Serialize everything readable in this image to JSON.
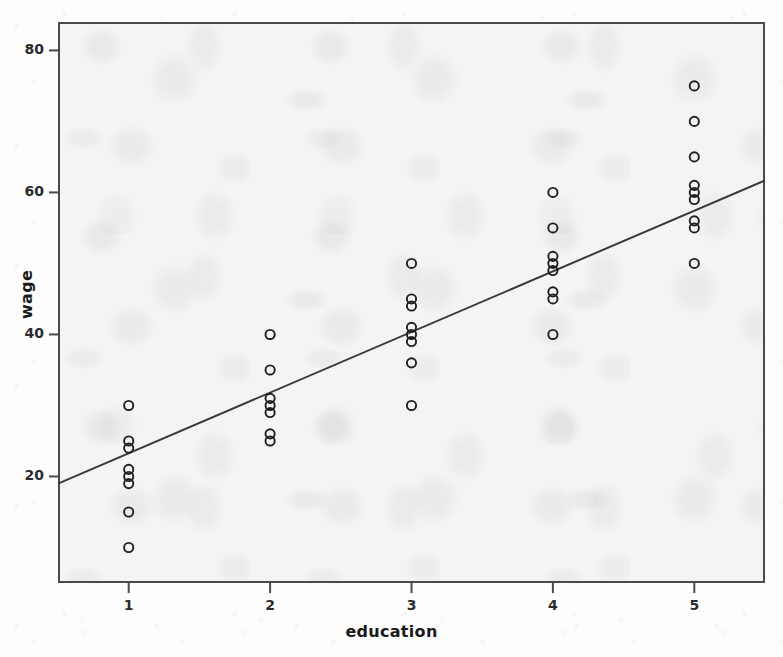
{
  "chart_data": {
    "type": "scatter",
    "title": "",
    "xlabel": "education",
    "ylabel": "wage",
    "xlim": [
      0.5,
      5.5
    ],
    "ylim": [
      5,
      84
    ],
    "grid": false,
    "legend": "none",
    "marker": "open-circle",
    "xticks": [
      "1",
      "2",
      "3",
      "4",
      "5"
    ],
    "xtick_values": [
      1,
      2,
      3,
      4,
      5
    ],
    "yticks": [
      "20",
      "40",
      "60",
      "80"
    ],
    "ytick_values": [
      20,
      40,
      60,
      80
    ],
    "points": [
      {
        "x": 1,
        "y": 30
      },
      {
        "x": 1,
        "y": 25
      },
      {
        "x": 1,
        "y": 24
      },
      {
        "x": 1,
        "y": 21
      },
      {
        "x": 1,
        "y": 20
      },
      {
        "x": 1,
        "y": 19
      },
      {
        "x": 1,
        "y": 15
      },
      {
        "x": 1,
        "y": 10
      },
      {
        "x": 2,
        "y": 40
      },
      {
        "x": 2,
        "y": 35
      },
      {
        "x": 2,
        "y": 31
      },
      {
        "x": 2,
        "y": 30
      },
      {
        "x": 2,
        "y": 29
      },
      {
        "x": 2,
        "y": 26
      },
      {
        "x": 2,
        "y": 25
      },
      {
        "x": 3,
        "y": 50
      },
      {
        "x": 3,
        "y": 45
      },
      {
        "x": 3,
        "y": 44
      },
      {
        "x": 3,
        "y": 41
      },
      {
        "x": 3,
        "y": 40
      },
      {
        "x": 3,
        "y": 39
      },
      {
        "x": 3,
        "y": 36
      },
      {
        "x": 3,
        "y": 30
      },
      {
        "x": 4,
        "y": 60
      },
      {
        "x": 4,
        "y": 55
      },
      {
        "x": 4,
        "y": 51
      },
      {
        "x": 4,
        "y": 50
      },
      {
        "x": 4,
        "y": 49
      },
      {
        "x": 4,
        "y": 46
      },
      {
        "x": 4,
        "y": 45
      },
      {
        "x": 4,
        "y": 40
      },
      {
        "x": 5,
        "y": 75
      },
      {
        "x": 5,
        "y": 70
      },
      {
        "x": 5,
        "y": 65
      },
      {
        "x": 5,
        "y": 61
      },
      {
        "x": 5,
        "y": 60
      },
      {
        "x": 5,
        "y": 59
      },
      {
        "x": 5,
        "y": 56
      },
      {
        "x": 5,
        "y": 55
      },
      {
        "x": 5,
        "y": 50
      }
    ],
    "fit_line": {
      "kind": "linear-regression",
      "x_start": 0.5,
      "y_start": 19.0,
      "x_end": 5.5,
      "y_end": 61.7
    },
    "colors": {
      "marker_stroke": "#1f1f1f",
      "fit_line": "#3a3a3a",
      "frame": "#4a4a4a",
      "plot_background": "#f4f4f4",
      "text": "#1a1a1a"
    }
  }
}
